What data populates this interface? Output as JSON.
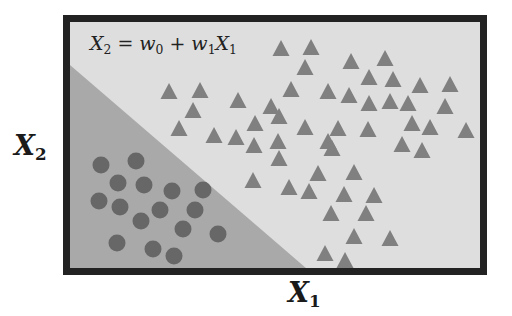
{
  "diagram": {
    "equation": {
      "lhs_var": "X",
      "lhs_sub": "2",
      "eq": "=",
      "t0_var": "w",
      "t0_sub": "0",
      "plus": "+",
      "t1_var": "w",
      "t1_sub": "1",
      "t1_x_var": "X",
      "t1_x_sub": "1"
    },
    "axes": {
      "x_label": {
        "var": "X",
        "sub": "1"
      },
      "y_label": {
        "var": "X",
        "sub": "2"
      }
    },
    "colors": {
      "frame": "#222222",
      "background_region": "#dedede",
      "shaded_region": "#a9a9a9",
      "triangle": "#808080",
      "circle": "#676767"
    },
    "frame": {
      "x": 63,
      "y": 15,
      "w": 424,
      "h": 260,
      "border": 7
    },
    "boundary": {
      "x1": 70,
      "y1": 62,
      "x2": 310,
      "y2": 268
    },
    "circles": [
      [
        101,
        165
      ],
      [
        136,
        161
      ],
      [
        118,
        183
      ],
      [
        144,
        185
      ],
      [
        172,
        191
      ],
      [
        203,
        190
      ],
      [
        99,
        201
      ],
      [
        120,
        207
      ],
      [
        160,
        210
      ],
      [
        195,
        210
      ],
      [
        141,
        221
      ],
      [
        183,
        229
      ],
      [
        218,
        234
      ],
      [
        117,
        243
      ],
      [
        153,
        249
      ],
      [
        174,
        256
      ]
    ],
    "triangles": [
      [
        281,
        48
      ],
      [
        311,
        47
      ],
      [
        305,
        67
      ],
      [
        351,
        61
      ],
      [
        385,
        58
      ],
      [
        169,
        91
      ],
      [
        200,
        90
      ],
      [
        193,
        110
      ],
      [
        238,
        100
      ],
      [
        291,
        89
      ],
      [
        328,
        91
      ],
      [
        349,
        95
      ],
      [
        369,
        77
      ],
      [
        393,
        79
      ],
      [
        420,
        85
      ],
      [
        450,
        84
      ],
      [
        179,
        128
      ],
      [
        214,
        135
      ],
      [
        236,
        137
      ],
      [
        255,
        123
      ],
      [
        271,
        106
      ],
      [
        279,
        116
      ],
      [
        305,
        127
      ],
      [
        338,
        128
      ],
      [
        369,
        103
      ],
      [
        390,
        101
      ],
      [
        408,
        103
      ],
      [
        412,
        123
      ],
      [
        445,
        106
      ],
      [
        430,
        127
      ],
      [
        466,
        130
      ],
      [
        254,
        145
      ],
      [
        278,
        141
      ],
      [
        328,
        141
      ],
      [
        368,
        129
      ],
      [
        402,
        144
      ],
      [
        422,
        150
      ],
      [
        279,
        158
      ],
      [
        332,
        148
      ],
      [
        253,
        180
      ],
      [
        289,
        187
      ],
      [
        318,
        173
      ],
      [
        354,
        172
      ],
      [
        309,
        191
      ],
      [
        344,
        194
      ],
      [
        374,
        195
      ],
      [
        331,
        213
      ],
      [
        366,
        213
      ],
      [
        354,
        236
      ],
      [
        390,
        238
      ],
      [
        325,
        253
      ],
      [
        345,
        260
      ]
    ]
  }
}
